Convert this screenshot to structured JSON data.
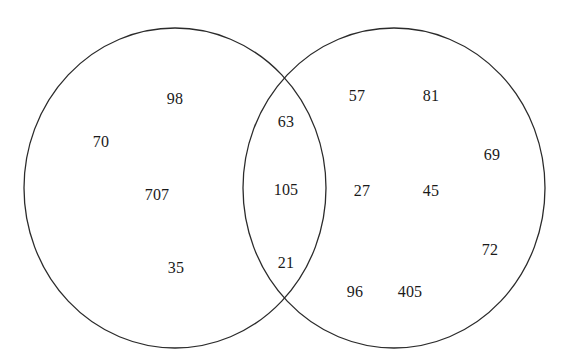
{
  "figure": {
    "type": "venn-diagram",
    "title_fragment": "",
    "background_color": "#ffffff",
    "stroke_color": "#2b2b2b",
    "stroke_width": 1.3,
    "text_color": "#1a1a1a",
    "width": 566,
    "height": 363
  },
  "shapes": {
    "left_circle": {
      "name": "left-set",
      "cx": 175,
      "cy": 188,
      "rx": 151,
      "ry": 160
    },
    "right_circle": {
      "name": "right-set",
      "cx": 394,
      "cy": 188,
      "rx": 151,
      "ry": 160
    }
  },
  "regions": {
    "left_only": {
      "name": "left-only-region",
      "values": [
        "98",
        "70",
        "707",
        "35"
      ]
    },
    "intersection": {
      "name": "intersection-region",
      "values": [
        "63",
        "105",
        "21"
      ]
    },
    "right_only": {
      "name": "right-only-region",
      "values": [
        "57",
        "81",
        "69",
        "27",
        "45",
        "72",
        "96",
        "405"
      ]
    }
  },
  "labels": [
    {
      "id": "left-98",
      "text": "98",
      "x": 175,
      "y": 99,
      "region": "left_only"
    },
    {
      "id": "left-70",
      "text": "70",
      "x": 101,
      "y": 142,
      "region": "left_only"
    },
    {
      "id": "left-707",
      "text": "707",
      "x": 157,
      "y": 195,
      "region": "left_only"
    },
    {
      "id": "left-35",
      "text": "35",
      "x": 176,
      "y": 268,
      "region": "left_only"
    },
    {
      "id": "mid-63",
      "text": "63",
      "x": 286,
      "y": 122,
      "region": "intersection"
    },
    {
      "id": "mid-105",
      "text": "105",
      "x": 286,
      "y": 190,
      "region": "intersection"
    },
    {
      "id": "mid-21",
      "text": "21",
      "x": 286,
      "y": 263,
      "region": "intersection"
    },
    {
      "id": "right-57",
      "text": "57",
      "x": 357,
      "y": 96,
      "region": "right_only"
    },
    {
      "id": "right-81",
      "text": "81",
      "x": 431,
      "y": 96,
      "region": "right_only"
    },
    {
      "id": "right-69",
      "text": "69",
      "x": 492,
      "y": 155,
      "region": "right_only"
    },
    {
      "id": "right-27",
      "text": "27",
      "x": 362,
      "y": 191,
      "region": "right_only"
    },
    {
      "id": "right-45",
      "text": "45",
      "x": 431,
      "y": 191,
      "region": "right_only"
    },
    {
      "id": "right-72",
      "text": "72",
      "x": 490,
      "y": 250,
      "region": "right_only"
    },
    {
      "id": "right-96",
      "text": "96",
      "x": 355,
      "y": 292,
      "region": "right_only"
    },
    {
      "id": "right-405",
      "text": "405",
      "x": 410,
      "y": 292,
      "region": "right_only"
    }
  ],
  "chart_data": {
    "type": "venn",
    "title": "",
    "xlabel": "",
    "ylabel": "",
    "sets": [
      "Left set",
      "Right set"
    ],
    "categories": [
      "left only",
      "intersection",
      "right only"
    ],
    "left_only_values": [
      98,
      70,
      707,
      35
    ],
    "intersection_values": [
      63,
      105,
      21
    ],
    "right_only_values": [
      57,
      81,
      69,
      27,
      45,
      72,
      96,
      405
    ],
    "all_values": [
      98,
      70,
      707,
      35,
      63,
      105,
      21,
      57,
      81,
      69,
      27,
      45,
      72,
      96,
      405
    ],
    "legend": [],
    "grid": false
  }
}
